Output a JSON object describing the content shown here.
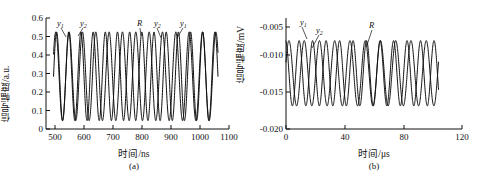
{
  "figure": {
    "background": "#ffffff",
    "stroke_color": "#111111"
  },
  "panel_a": {
    "caption": "(a)",
    "xlabel": "时间/ns",
    "ylabel": "信号幅度/a.u.",
    "xticks": [
      "500",
      "600",
      "700",
      "800",
      "900",
      "1000",
      "1100"
    ],
    "yticks": [
      "0",
      "0.1",
      "0.2",
      "0.3",
      "0.4",
      "0.5",
      "0.6"
    ],
    "annotations": [
      {
        "name": "y1-left",
        "label": "y",
        "sub": "1"
      },
      {
        "name": "y2-left",
        "label": "y",
        "sub": "2"
      },
      {
        "name": "R-mid",
        "label": "R",
        "sub": ""
      },
      {
        "name": "y2-right",
        "label": "y",
        "sub": "2"
      },
      {
        "name": "y1-right",
        "label": "y",
        "sub": "1"
      }
    ]
  },
  "panel_b": {
    "caption": "(b)",
    "xlabel": "时间/μs",
    "ylabel": "信号幅度/mV",
    "xticks": [
      "0",
      "40",
      "80",
      "120"
    ],
    "yticks": [
      "-0.020",
      "-0.015",
      "-0.010",
      "-0.005"
    ],
    "annotations": [
      {
        "name": "y1",
        "label": "y",
        "sub": "1"
      },
      {
        "name": "y2",
        "label": "y",
        "sub": "2"
      },
      {
        "name": "R",
        "label": "R",
        "sub": ""
      }
    ]
  },
  "chart_data": [
    {
      "type": "line",
      "panel": "(a)",
      "title": "",
      "xlabel": "时间/ns",
      "ylabel": "信号幅度/a.u.",
      "xlim": [
        470,
        1100
      ],
      "ylim": [
        0,
        0.6
      ],
      "xticks": [
        500,
        600,
        700,
        800,
        900,
        1000,
        1100
      ],
      "yticks": [
        0,
        0.1,
        0.2,
        0.3,
        0.4,
        0.5,
        0.6
      ],
      "grid": false,
      "legend": "none",
      "annotations": [
        "y1",
        "y2",
        "R",
        "y2",
        "y1"
      ],
      "series": [
        {
          "name": "y1",
          "description": "sinusoid, period 42 ns, amplitude 0.24, offset 0.285",
          "period_ns": 42,
          "amplitude": 0.24,
          "offset": 0.285,
          "phase_deg": 0,
          "x_start": 495,
          "x_end": 1062
        },
        {
          "name": "y2",
          "description": "sinusoid, period 46 ns, amplitude 0.24, offset 0.285",
          "period_ns": 46,
          "amplitude": 0.24,
          "offset": 0.285,
          "phase_deg": 30,
          "x_start": 495,
          "x_end": 1062
        }
      ],
      "notes": "Two near-equal-frequency sinusoids overlapping; crossings produce beat pattern. Peaks ~0.52, troughs ~0.04."
    },
    {
      "type": "line",
      "panel": "(b)",
      "title": "",
      "xlabel": "时间/μs",
      "ylabel": "信号幅度/mV",
      "xlim": [
        0,
        120
      ],
      "ylim": [
        -0.02,
        -0.005
      ],
      "xticks": [
        0,
        40,
        80,
        120
      ],
      "yticks": [
        -0.02,
        -0.015,
        -0.01,
        -0.005
      ],
      "grid": false,
      "legend": "none",
      "annotations": [
        "y1",
        "y2",
        "R"
      ],
      "series": [
        {
          "name": "y1",
          "description": "sinusoid, period 9.2 us, amplitude 0.0048, offset -0.0118",
          "period_us": 9.2,
          "amplitude": 0.0048,
          "offset": -0.0118,
          "phase_deg": 100,
          "x_start": 0,
          "x_end": 104
        },
        {
          "name": "y2",
          "description": "sinusoid, period 10.4 us, amplitude 0.0048, offset -0.0118",
          "period_us": 10.4,
          "amplitude": 0.0048,
          "offset": -0.0118,
          "phase_deg": 20,
          "x_start": 0,
          "x_end": 104
        }
      ],
      "notes": "Beat envelope with node near t=50-58 us where the two curves separate into smooth upper (~-0.006) and lower (~-0.010) lobes, then amplitude resurges. Extremes approx -0.0047 to -0.0185."
    }
  ]
}
